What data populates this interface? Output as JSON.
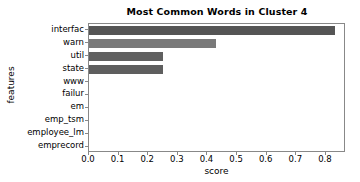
{
  "chart_data": {
    "type": "bar",
    "orientation": "horizontal",
    "title": "Most Common Words in Cluster 4",
    "xlabel": "score",
    "ylabel": "features",
    "categories": [
      "interfac",
      "warn",
      "util",
      "state",
      "www",
      "failur",
      "em",
      "emp_tsm",
      "employee_lm",
      "emprecord"
    ],
    "values": [
      0.83,
      0.43,
      0.25,
      0.25,
      0.0,
      0.0,
      0.0,
      0.0,
      0.0,
      0.0
    ],
    "bar_colors": [
      "#555555",
      "#7a7a7a",
      "#606060",
      "#5e5e5e",
      "#666666",
      "#666666",
      "#666666",
      "#666666",
      "#666666",
      "#666666"
    ],
    "xlim": [
      0.0,
      0.8677419354838709
    ],
    "xticks": [
      0.0,
      0.1,
      0.2,
      0.3,
      0.4,
      0.5,
      0.6,
      0.7,
      0.8
    ],
    "xticklabels": [
      "0.0",
      "0.1",
      "0.2",
      "0.3",
      "0.4",
      "0.5",
      "0.6",
      "0.7",
      "0.8"
    ],
    "grid": false,
    "legend": null,
    "frame_color": "#888888",
    "background": "#ffffff"
  }
}
